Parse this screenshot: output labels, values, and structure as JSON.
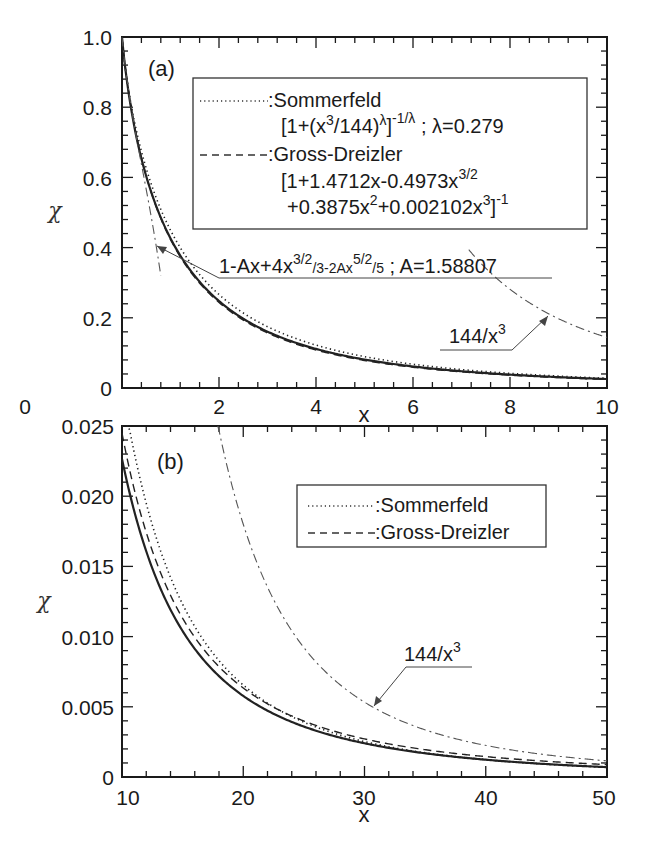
{
  "figure": {
    "panels": [
      {
        "tag": "(a)",
        "xlabel": "x",
        "ylabel": "χ",
        "xticks": [
          "0",
          "2",
          "4",
          "6",
          "8",
          "10"
        ],
        "yticks": [
          "0",
          "0.2",
          "0.4",
          "0.6",
          "0.8",
          "1.0"
        ],
        "legend": {
          "sommerfeld_name": ":Sommerfeld",
          "sommerfeld_formula": "[1+(x³/144)^λ]^(-1/λ) ; λ=0.279",
          "sommerfeld_formula_main": "[1+(x",
          "sommerfeld_formula_parts": [
            "[1+(x",
            "3",
            "/144)",
            "λ",
            "]",
            "-1/λ",
            " ; λ=0.279"
          ],
          "gross_name": ":Gross-Dreizler",
          "gross_line1_parts": [
            "[1+1.4712x-0.4973x",
            "3/2"
          ],
          "gross_line2_parts": [
            "+0.3875x",
            "2",
            "+0.002102x",
            "3",
            "]",
            "-1"
          ]
        },
        "annotations": {
          "series_label_parts": [
            "1-Ax+4x",
            "3/2",
            "/3-2Ax",
            "5/2",
            "/5",
            "  ; A=1.58807"
          ],
          "asymptote_parts": [
            "144/x",
            "3"
          ]
        }
      },
      {
        "tag": "(b)",
        "xlabel": "x",
        "ylabel": "χ",
        "xticks": [
          "10",
          "20",
          "30",
          "40",
          "50"
        ],
        "yticks": [
          "0",
          "0.005",
          "0.010",
          "0.015",
          "0.020",
          "0.025"
        ],
        "legend": {
          "sommerfeld_name": ":Sommerfeld",
          "gross_name": ":Gross-Dreizler"
        },
        "annotations": {
          "asymptote_parts": [
            "144/x",
            "3"
          ]
        }
      }
    ],
    "params": {
      "lambda": 0.279,
      "A": 1.58807
    },
    "colors": {
      "axis": "#1a1a1a",
      "curve": "#222222",
      "gray_curve": "#555555",
      "background": "#ffffff"
    }
  },
  "chart_data": [
    {
      "type": "line",
      "title": "(a)",
      "xlabel": "x",
      "ylabel": "χ",
      "xlim": [
        0,
        10
      ],
      "ylim": [
        0,
        1.0
      ],
      "grid": false,
      "legend_position": "upper right (inside)",
      "x": [
        0,
        0.5,
        1,
        1.5,
        2,
        3,
        4,
        5,
        6,
        7,
        8,
        9,
        10
      ],
      "series": [
        {
          "name": "Thomas-Fermi (exact, solid)",
          "style": "solid",
          "values": [
            1.0,
            0.607,
            0.424,
            0.315,
            0.243,
            0.157,
            0.108,
            0.079,
            0.059,
            0.046,
            0.037,
            0.029,
            0.024
          ]
        },
        {
          "name": "Sommerfeld [1+(x^3/144)^λ]^(-1/λ), λ=0.279",
          "style": "dotted",
          "values": [
            1.0,
            0.64,
            0.46,
            0.35,
            0.275,
            0.18,
            0.126,
            0.092,
            0.07,
            0.054,
            0.043,
            0.035,
            0.029
          ]
        },
        {
          "name": "Gross-Dreizler [1+1.4712x-0.4973x^(3/2)+0.3875x^2+0.002102x^3]^(-1)",
          "style": "dashed",
          "values": [
            1.0,
            0.623,
            0.424,
            0.307,
            0.236,
            0.156,
            0.11,
            0.081,
            0.062,
            0.049,
            0.039,
            0.032,
            0.027
          ]
        },
        {
          "name": "1-Ax+4x^(3/2)/3-2Ax^(5/2)/5 ; A=1.58807",
          "style": "dash-dot",
          "x_range": [
            0,
            0.8
          ],
          "values": [
            1.0,
            0.4
          ]
        },
        {
          "name": "144/x^3",
          "style": "dash-dot",
          "x_range": [
            7.2,
            10
          ],
          "values": [
            0.386,
            0.281,
            0.198,
            0.144
          ]
        }
      ],
      "annotations": [
        "(a)",
        "1-Ax+4x^{3/2}/3-2Ax^{5/2}/5 ; A=1.58807",
        "144/x^3"
      ]
    },
    {
      "type": "line",
      "title": "(b)",
      "xlabel": "x",
      "ylabel": "χ",
      "xlim": [
        10,
        50
      ],
      "ylim": [
        0,
        0.025
      ],
      "grid": false,
      "legend_position": "upper right (inside)",
      "x": [
        10,
        15,
        20,
        25,
        30,
        35,
        40,
        45,
        50
      ],
      "series": [
        {
          "name": "Thomas-Fermi (exact, solid)",
          "style": "solid",
          "values": [
            0.0243,
            0.0118,
            0.0058,
            0.0035,
            0.0023,
            0.0016,
            0.0011,
            0.0008,
            0.0006
          ]
        },
        {
          "name": "Sommerfeld",
          "style": "dotted",
          "values": [
            0.029,
            0.0136,
            0.0072,
            0.0043,
            0.0028,
            0.0019,
            0.0014,
            0.0011,
            0.0008
          ]
        },
        {
          "name": "Gross-Dreizler",
          "style": "dashed",
          "values": [
            0.0265,
            0.0125,
            0.0067,
            0.004,
            0.0027,
            0.0019,
            0.0014,
            0.0011,
            0.0009
          ]
        },
        {
          "name": "144/x^3",
          "style": "dash-dot",
          "x_range": [
            17.9,
            50
          ],
          "values": [
            0.0251,
            0.018,
            0.0092,
            0.0053,
            0.0034,
            0.0023,
            0.0016,
            0.0012
          ]
        }
      ],
      "annotations": [
        "(b)",
        "144/x^3"
      ]
    }
  ]
}
